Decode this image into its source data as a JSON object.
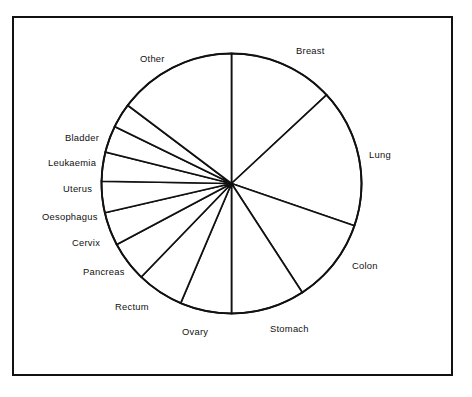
{
  "figure": {
    "type": "pie-chart-figure",
    "background_color": "#ffffff",
    "line_color": "#111111",
    "frame": {
      "name": "figure-border",
      "x": 12,
      "y": 16,
      "width": 441,
      "height": 360
    }
  },
  "chart_data": {
    "type": "pie",
    "title": "",
    "subtitle": "",
    "xlabel": "",
    "ylabel": "",
    "grid": false,
    "legend_position": "outside-labels",
    "center": {
      "x": 231.5,
      "y": 183.5
    },
    "radius": 130,
    "start_angle_deg": 0,
    "direction": "clockwise",
    "labels": [
      "Breast",
      "Lung",
      "Colon",
      "Stomach",
      "Ovary",
      "Rectum",
      "Pancreas",
      "Cervix",
      "Oesophagus",
      "Uterus",
      "Leukaemia",
      "Bladder",
      "Other"
    ],
    "angles_deg": [
      47,
      62,
      38,
      33,
      23,
      21,
      18,
      15,
      14,
      13,
      12,
      11,
      53
    ],
    "values_percent": [
      13.1,
      17.2,
      10.6,
      9.2,
      6.4,
      5.8,
      5.0,
      4.2,
      3.9,
      3.6,
      3.3,
      3.1,
      14.6
    ],
    "boundaries_deg": [
      0,
      47,
      109,
      147,
      180,
      203,
      224,
      242,
      257,
      271,
      284,
      296,
      307,
      360
    ],
    "slices": [
      {
        "label": "Breast",
        "start_deg": 0,
        "end_deg": 47,
        "angle_deg": 47,
        "percent": 13.1
      },
      {
        "label": "Lung",
        "start_deg": 47,
        "end_deg": 109,
        "angle_deg": 62,
        "percent": 17.2
      },
      {
        "label": "Colon",
        "start_deg": 109,
        "end_deg": 147,
        "angle_deg": 38,
        "percent": 10.6
      },
      {
        "label": "Stomach",
        "start_deg": 147,
        "end_deg": 180,
        "angle_deg": 33,
        "percent": 9.2
      },
      {
        "label": "Ovary",
        "start_deg": 180,
        "end_deg": 203,
        "angle_deg": 23,
        "percent": 6.4
      },
      {
        "label": "Rectum",
        "start_deg": 203,
        "end_deg": 224,
        "angle_deg": 21,
        "percent": 5.8
      },
      {
        "label": "Pancreas",
        "start_deg": 224,
        "end_deg": 242,
        "angle_deg": 18,
        "percent": 5.0
      },
      {
        "label": "Cervix",
        "start_deg": 242,
        "end_deg": 257,
        "angle_deg": 15,
        "percent": 4.2
      },
      {
        "label": "Oesophagus",
        "start_deg": 257,
        "end_deg": 271,
        "angle_deg": 14,
        "percent": 3.9
      },
      {
        "label": "Uterus",
        "start_deg": 271,
        "end_deg": 284,
        "angle_deg": 13,
        "percent": 3.6
      },
      {
        "label": "Leukaemia",
        "start_deg": 284,
        "end_deg": 296,
        "angle_deg": 12,
        "percent": 3.3
      },
      {
        "label": "Bladder",
        "start_deg": 296,
        "end_deg": 307,
        "angle_deg": 11,
        "percent": 3.1
      },
      {
        "label": "Other",
        "start_deg": 307,
        "end_deg": 360,
        "angle_deg": 53,
        "percent": 14.6
      }
    ]
  },
  "label_positions": [
    {
      "key": "breast",
      "text": "Breast",
      "x": 296,
      "y": 46,
      "anchor": "start"
    },
    {
      "key": "lung",
      "text": "Lung",
      "x": 369,
      "y": 150,
      "anchor": "start"
    },
    {
      "key": "colon",
      "text": "Colon",
      "x": 352,
      "y": 261,
      "anchor": "start"
    },
    {
      "key": "stomach",
      "text": "Stomach",
      "x": 270,
      "y": 324,
      "anchor": "start"
    },
    {
      "key": "ovary",
      "text": "Ovary",
      "x": 182,
      "y": 327,
      "anchor": "start"
    },
    {
      "key": "rectum",
      "text": "Rectum",
      "x": 115,
      "y": 302,
      "anchor": "start"
    },
    {
      "key": "pancreas",
      "text": "Pancreas",
      "x": 83,
      "y": 267,
      "anchor": "start"
    },
    {
      "key": "cervix",
      "text": "Cervix",
      "x": 72,
      "y": 238,
      "anchor": "start"
    },
    {
      "key": "oesophagus",
      "text": "Oesophagus",
      "x": 42,
      "y": 212,
      "anchor": "start"
    },
    {
      "key": "uterus",
      "text": "Uterus",
      "x": 63,
      "y": 184,
      "anchor": "start"
    },
    {
      "key": "leukaemia",
      "text": "Leukaemia",
      "x": 48,
      "y": 158,
      "anchor": "start"
    },
    {
      "key": "bladder",
      "text": "Bladder",
      "x": 65,
      "y": 133,
      "anchor": "start"
    },
    {
      "key": "other",
      "text": "Other",
      "x": 140,
      "y": 54,
      "anchor": "start"
    }
  ]
}
